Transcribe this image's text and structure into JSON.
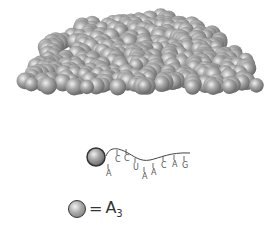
{
  "diagram": {
    "type": "space-filling molecular model",
    "sphere_color": "#9e9e9e",
    "highlight_sphere": {
      "x": 96,
      "y": 157,
      "r": 9,
      "stroke": "#333333"
    },
    "rna": {
      "bases": [
        {
          "label": "A",
          "x": 106,
          "y": 176
        },
        {
          "label": "C",
          "x": 115,
          "y": 162
        },
        {
          "label": "C",
          "x": 124,
          "y": 161
        },
        {
          "label": "U",
          "x": 133,
          "y": 170
        },
        {
          "label": "A",
          "x": 142,
          "y": 179
        },
        {
          "label": "A",
          "x": 151,
          "y": 175
        },
        {
          "label": "C",
          "x": 161,
          "y": 168
        },
        {
          "label": "A",
          "x": 172,
          "y": 167
        },
        {
          "label": "G",
          "x": 182,
          "y": 168
        }
      ]
    }
  },
  "legend": {
    "equals": "=",
    "symbol": "A",
    "subscript": "3"
  }
}
